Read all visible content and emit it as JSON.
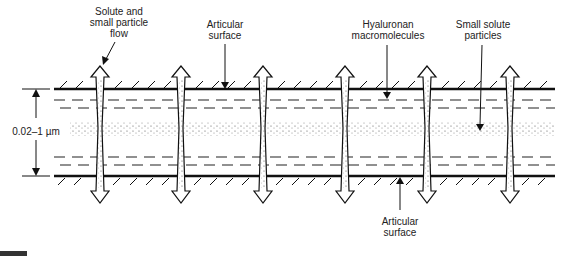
{
  "labels": {
    "flow_line1": "Solute and",
    "flow_line2": "small particle",
    "flow_line3": "flow",
    "top_surface_line1": "Articular",
    "top_surface_line2": "surface",
    "hyaluronan_line1": "Hyaluronan",
    "hyaluronan_line2": "macromolecules",
    "particles_line1": "Small solute",
    "particles_line2": "particles",
    "thickness": "0.02–1 µm",
    "bottom_surface_line1": "Articular",
    "bottom_surface_line2": "surface"
  },
  "diagram": {
    "arrow_x": [
      100,
      181,
      263,
      345,
      427,
      510
    ],
    "top_surface_y": 89,
    "bottom_surface_y": 176,
    "line_color": "#111111"
  }
}
